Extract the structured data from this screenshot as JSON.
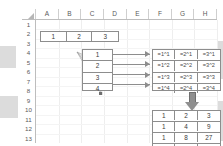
{
  "app": {
    "kind": "spreadsheet-diagram",
    "accent_gray": "#8d8d8d",
    "grid_line": "#eeeeee"
  },
  "sheet": {
    "corner_icon": "select-all-triangle-icon",
    "columns": [
      "A",
      "B",
      "C",
      "D",
      "E",
      "F",
      "G",
      "H"
    ],
    "rows": [
      "1",
      "2",
      "3",
      "4",
      "5",
      "6",
      "7",
      "8",
      "9",
      "10",
      "11",
      "12",
      "13"
    ]
  },
  "source_row": {
    "label": "base-values",
    "cells": [
      "1",
      "2",
      "3"
    ]
  },
  "exponent_list": {
    "label": "exponent-values",
    "cells": [
      "1",
      "2",
      "3",
      "4"
    ]
  },
  "formula_grid": {
    "label": "power-formulas",
    "rows": [
      [
        "=1^1",
        "=2^1",
        "=3^1"
      ],
      [
        "=1^2",
        "=2^2",
        "=3^2"
      ],
      [
        "=1^3",
        "=2^3",
        "=3^3"
      ],
      [
        "=1^4",
        "=2^4",
        "=3^4"
      ]
    ]
  },
  "result_grid": {
    "label": "computed-results",
    "rows": [
      [
        "1",
        "2",
        "3"
      ],
      [
        "1",
        "4",
        "9"
      ],
      [
        "1",
        "8",
        "27"
      ],
      [
        "1",
        "16",
        "81"
      ]
    ]
  },
  "connectors": {
    "fan_label": "fan-out-from-base-values",
    "row_arrow_label": "row-to-formula-arrow",
    "down_arrow_label": "evaluate-down-arrow"
  }
}
